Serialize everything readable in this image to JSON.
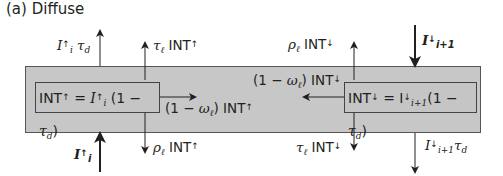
{
  "title": "(a) Diffuse",
  "colors": {
    "layer_fill": "#c7c7c7",
    "line": "#231f20",
    "background": "#ffffff"
  },
  "labels": {
    "I_up_transmitted": {
      "I": "I",
      "arrow": "↑",
      "sub": "i",
      "tau": "τ",
      "tau_sub": "d"
    },
    "tau_INT_up": {
      "tau": "τ",
      "tau_sub": "ℓ",
      "text": " INT",
      "arrow": "↑"
    },
    "rho_INT_down": {
      "rho": "ρ",
      "rho_sub": "ℓ",
      "text": " INT",
      "arrow": "↓"
    },
    "I_down_incident": {
      "I": "I",
      "arrow": "↓",
      "sub": "i+1"
    },
    "absorbed_down": {
      "prefix": "(1 − ",
      "omega": "ω",
      "omega_sub": "ℓ",
      "suffix": ") INT",
      "arrow": "↓"
    },
    "absorbed_up": {
      "prefix": "(1 − ",
      "omega": "ω",
      "omega_sub": "ℓ",
      "suffix": ") INT",
      "arrow": "↑"
    },
    "rho_INT_up": {
      "rho": "ρ",
      "rho_sub": "ℓ",
      "text": " INT",
      "arrow": "↑"
    },
    "I_up_incident": {
      "I": "I",
      "arrow": "↑",
      "sub": "i"
    },
    "tau_INT_down": {
      "tau": "τ",
      "tau_sub": "ℓ",
      "text": " INT",
      "arrow": "↓"
    },
    "I_down_transmitted": {
      "I": "I",
      "arrow": "↓",
      "sub": "i+1",
      "tau": "τ",
      "tau_sub": "d"
    }
  },
  "boxes": {
    "left": {
      "lhs": "INT",
      "arrow": "↑",
      "eq": " = ",
      "I": "I",
      "I_arrow": "↑",
      "I_sub": "i",
      "paren_open": " (1 − ",
      "tau": "τ",
      "tau_sub": "d",
      "paren_close": ")"
    },
    "right": {
      "lhs": "INT",
      "arrow": "↓",
      "eq": " = ",
      "I": "I",
      "I_arrow": "↓",
      "I_sub": "i+1",
      "paren_open": "(1 − ",
      "tau": "τ",
      "tau_sub": "d",
      "paren_close": ")"
    }
  }
}
